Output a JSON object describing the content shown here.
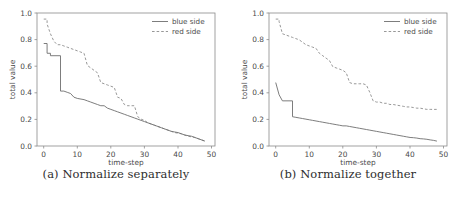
{
  "figure": {
    "background": "#ffffff",
    "line_color": "#6e6e6e",
    "axis_color": "#8a8a8a"
  },
  "chart_data": [
    {
      "type": "line",
      "panel_id": "a",
      "caption": "(a) Normalize separately",
      "title": "",
      "xlabel": "time-step",
      "ylabel": "total value",
      "xlim": [
        -2,
        51
      ],
      "ylim": [
        -0.04,
        1.05
      ],
      "xticks": [
        0,
        10,
        20,
        30,
        40,
        50
      ],
      "xticklabels": [
        "0",
        "10",
        "20",
        "30",
        "40",
        "50"
      ],
      "yticks": [
        0.0,
        0.2,
        0.4,
        0.6,
        0.8,
        1.0
      ],
      "yticklabels": [
        "0.0",
        "0.2",
        "0.4",
        "0.6",
        "0.8",
        "1.0"
      ],
      "grid": false,
      "legend_position": "upper right",
      "series": [
        {
          "name": "blue side",
          "style": "solid",
          "color": "#6e6e6e",
          "x": [
            0,
            1,
            1,
            2,
            2,
            5,
            5,
            6,
            7,
            8,
            9,
            10,
            12,
            13,
            14,
            15,
            16,
            17,
            18,
            19,
            20,
            21,
            22,
            23,
            24,
            25,
            26,
            27,
            28,
            29,
            30,
            31,
            32,
            33,
            34,
            35,
            36,
            37,
            38,
            39,
            40,
            41,
            42,
            43,
            44,
            45,
            46,
            47,
            48
          ],
          "y": [
            0.8,
            0.8,
            0.72,
            0.72,
            0.7,
            0.7,
            0.41,
            0.41,
            0.4,
            0.39,
            0.36,
            0.35,
            0.34,
            0.33,
            0.32,
            0.31,
            0.3,
            0.29,
            0.29,
            0.27,
            0.26,
            0.25,
            0.24,
            0.23,
            0.22,
            0.21,
            0.2,
            0.19,
            0.18,
            0.17,
            0.16,
            0.15,
            0.14,
            0.13,
            0.12,
            0.11,
            0.1,
            0.09,
            0.08,
            0.075,
            0.07,
            0.06,
            0.05,
            0.045,
            0.04,
            0.03,
            0.02,
            0.01,
            0.0
          ]
        },
        {
          "name": "red side",
          "style": "dashed",
          "color": "#8c8c8c",
          "x": [
            0,
            1,
            1,
            2,
            3,
            4,
            5,
            6,
            7,
            8,
            9,
            10,
            11,
            12,
            13,
            14,
            15,
            16,
            17,
            18,
            19,
            20,
            21,
            22,
            23,
            24,
            25,
            26,
            27,
            28,
            29,
            30,
            31,
            32,
            33,
            34,
            35,
            36,
            37,
            38,
            39,
            40,
            41,
            42,
            43,
            44,
            45,
            46,
            47,
            48
          ],
          "y": [
            1.0,
            1.0,
            0.96,
            0.88,
            0.82,
            0.79,
            0.79,
            0.78,
            0.77,
            0.76,
            0.75,
            0.74,
            0.73,
            0.72,
            0.62,
            0.6,
            0.58,
            0.56,
            0.48,
            0.47,
            0.46,
            0.45,
            0.44,
            0.36,
            0.35,
            0.3,
            0.29,
            0.29,
            0.29,
            0.2,
            0.18,
            0.17,
            0.15,
            0.14,
            0.13,
            0.12,
            0.11,
            0.1,
            0.09,
            0.08,
            0.07,
            0.065,
            0.06,
            0.05,
            0.04,
            0.035,
            0.03,
            0.02,
            0.01,
            0.0
          ]
        }
      ]
    },
    {
      "type": "line",
      "panel_id": "b",
      "caption": "(b) Normalize together",
      "title": "",
      "xlabel": "time-step",
      "ylabel": "total value",
      "xlim": [
        -2,
        51
      ],
      "ylim": [
        -0.04,
        1.05
      ],
      "xticks": [
        0,
        10,
        20,
        30,
        40,
        50
      ],
      "xticklabels": [
        "0",
        "10",
        "20",
        "30",
        "40",
        "50"
      ],
      "yticks": [
        0.0,
        0.2,
        0.4,
        0.6,
        0.8,
        1.0
      ],
      "yticklabels": [
        "0.0",
        "0.2",
        "0.4",
        "0.6",
        "0.8",
        "1.0"
      ],
      "grid": false,
      "legend_position": "upper right",
      "series": [
        {
          "name": "blue side",
          "style": "solid",
          "color": "#6e6e6e",
          "x": [
            0,
            1,
            2,
            2,
            5,
            5,
            6,
            7,
            8,
            9,
            10,
            11,
            12,
            13,
            14,
            15,
            16,
            17,
            18,
            19,
            20,
            21,
            22,
            23,
            24,
            25,
            26,
            27,
            28,
            29,
            30,
            31,
            32,
            33,
            34,
            35,
            36,
            37,
            38,
            39,
            40,
            41,
            42,
            43,
            44,
            45,
            46,
            47,
            48
          ],
          "y": [
            0.48,
            0.38,
            0.33,
            0.33,
            0.33,
            0.2,
            0.195,
            0.19,
            0.185,
            0.18,
            0.175,
            0.17,
            0.165,
            0.16,
            0.155,
            0.15,
            0.145,
            0.14,
            0.135,
            0.13,
            0.125,
            0.125,
            0.12,
            0.115,
            0.11,
            0.105,
            0.1,
            0.095,
            0.09,
            0.085,
            0.08,
            0.075,
            0.07,
            0.065,
            0.06,
            0.055,
            0.05,
            0.045,
            0.04,
            0.035,
            0.03,
            0.028,
            0.025,
            0.02,
            0.018,
            0.015,
            0.01,
            0.006,
            0.0
          ]
        },
        {
          "name": "red side",
          "style": "dashed",
          "color": "#8c8c8c",
          "x": [
            0,
            1,
            1,
            2,
            3,
            4,
            5,
            6,
            7,
            8,
            9,
            10,
            11,
            12,
            13,
            14,
            15,
            16,
            17,
            18,
            19,
            20,
            21,
            22,
            23,
            24,
            25,
            26,
            27,
            28,
            29,
            30,
            31,
            32,
            33,
            34,
            35,
            36,
            37,
            38,
            39,
            40,
            41,
            42,
            43,
            44,
            45,
            46,
            47,
            48
          ],
          "y": [
            1.0,
            1.0,
            0.98,
            0.88,
            0.87,
            0.86,
            0.85,
            0.84,
            0.83,
            0.81,
            0.79,
            0.78,
            0.77,
            0.76,
            0.72,
            0.7,
            0.68,
            0.66,
            0.61,
            0.6,
            0.59,
            0.58,
            0.56,
            0.48,
            0.47,
            0.47,
            0.47,
            0.47,
            0.46,
            0.4,
            0.33,
            0.32,
            0.32,
            0.31,
            0.31,
            0.3,
            0.3,
            0.295,
            0.29,
            0.285,
            0.28,
            0.28,
            0.275,
            0.27,
            0.27,
            0.265,
            0.26,
            0.26,
            0.26,
            0.26
          ]
        }
      ]
    }
  ]
}
